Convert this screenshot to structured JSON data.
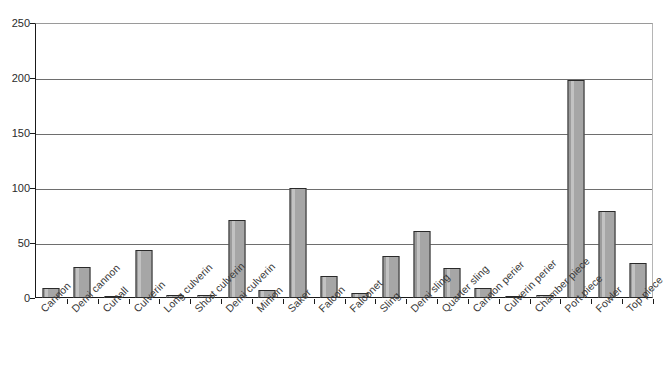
{
  "chart_data": {
    "type": "bar",
    "title": "",
    "subtitle": "",
    "xlabel": "",
    "ylabel": "",
    "ylim": [
      0,
      250
    ],
    "yticks": [
      0,
      50,
      100,
      150,
      200,
      250
    ],
    "grid": true,
    "legend": false,
    "legend_position": "none",
    "series_name": "Count",
    "bar_color": "#a3a3a3",
    "bar_border_color": "#2a2a2a",
    "axis_color": "#1a1a1a",
    "gridline_color": "#6e6e6e",
    "categories": [
      "Cannon",
      "Demi cannon",
      "Curtall",
      "Culverin",
      "Long culverin",
      "Short culverin",
      "Demi culverin",
      "Minion",
      "Saker",
      "Falcon",
      "Falconet",
      "Sling",
      "Demi sling",
      "Quarter sling",
      "Cannon perier",
      "Culverin perier",
      "Chamber piece",
      "Port piece",
      "Fowler",
      "Top piece"
    ],
    "values": [
      9,
      28,
      1,
      44,
      3,
      3,
      71,
      7,
      100,
      20,
      5,
      38,
      61,
      27,
      9,
      1,
      3,
      198,
      79,
      32
    ]
  }
}
